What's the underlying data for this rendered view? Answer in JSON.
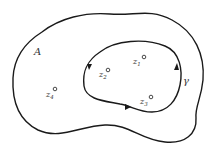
{
  "diagram": {
    "title": "",
    "region_label": "A",
    "contour_label": "γ",
    "points": [
      {
        "name": "z",
        "sub": "1",
        "label": "z1"
      },
      {
        "name": "z",
        "sub": "2",
        "label": "z2"
      },
      {
        "name": "z",
        "sub": "3",
        "label": "z3"
      },
      {
        "name": "z",
        "sub": "4",
        "label": "z4"
      }
    ],
    "colors": {
      "stroke": "#1a1a1a",
      "text": "#333333",
      "background": "#ffffff"
    },
    "contour_orientation": "counterclockwise"
  }
}
